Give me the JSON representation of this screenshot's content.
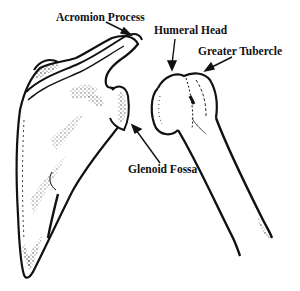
{
  "diagram": {
    "labels": [
      {
        "id": "acromion",
        "text": "Acromion Process"
      },
      {
        "id": "humeral-head",
        "text": "Humeral Head"
      },
      {
        "id": "greater-tubercle",
        "text": "Greater Tubercle"
      },
      {
        "id": "glenoid-fossa",
        "text": "Glenoid Fossa"
      }
    ],
    "colors": {
      "ink": "#111111",
      "background": "#ffffff"
    }
  }
}
